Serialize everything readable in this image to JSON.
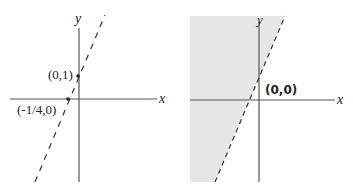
{
  "left_graph": {
    "x_axis_label": "x",
    "y_axis_label": "y",
    "line_style": "dashed",
    "points": [
      {
        "label": "(0,1)",
        "x": 0,
        "y": 1
      },
      {
        "label": "(-1/4,0)",
        "x": -0.25,
        "y": 0
      }
    ]
  },
  "right_graph": {
    "x_axis_label": "x",
    "y_axis_label": "y",
    "line_style": "dashed",
    "test_point_label": "(0,0)",
    "shaded_region": "left of line",
    "shade_color": "#e6e6e6"
  },
  "colors": {
    "axis": "#555555",
    "line": "#333333",
    "shade": "#e6e6e6"
  }
}
